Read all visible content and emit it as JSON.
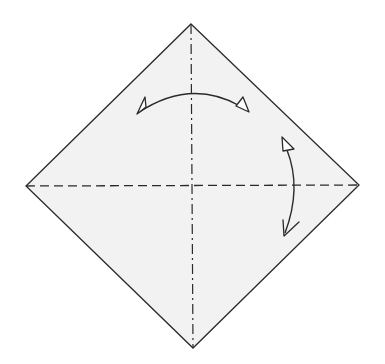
{
  "diagram": {
    "type": "origami-fold-diagram",
    "background": "#ffffff",
    "paper_fill": "#f2f2f2",
    "line_color": "#2a2a2a",
    "square": {
      "top": [
        191,
        24
      ],
      "right": [
        359,
        185
      ],
      "bottom": [
        193,
        348
      ],
      "left": [
        26,
        186
      ]
    },
    "creases": [
      {
        "name": "vertical-valley-fold",
        "style": "dash-dot",
        "from": [
          191,
          24
        ],
        "to": [
          193,
          348
        ]
      },
      {
        "name": "horizontal-valley-fold",
        "style": "dashed",
        "from": [
          26,
          186
        ],
        "to": [
          359,
          185
        ]
      }
    ],
    "arrows": [
      {
        "name": "fold-and-unfold-left-to-right",
        "kind": "fold-unfold"
      },
      {
        "name": "fold-and-unfold-top-to-bottom",
        "kind": "fold-unfold"
      }
    ]
  }
}
